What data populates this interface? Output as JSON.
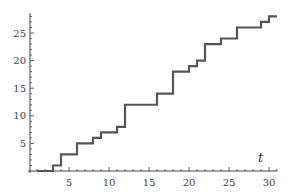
{
  "chart_data": {
    "type": "line",
    "subtype": "step",
    "title": "",
    "xlabel": "t",
    "ylabel": "",
    "xlim": [
      0,
      32
    ],
    "ylim": [
      0,
      28.5
    ],
    "xticks": [
      5,
      10,
      15,
      20,
      25,
      30
    ],
    "yticks": [
      5,
      10,
      15,
      20,
      25
    ],
    "grid": false,
    "legend": null,
    "series": [
      {
        "name": "counting process",
        "color": "#555555",
        "x": [
          1,
          3,
          4,
          6,
          8,
          9,
          11,
          12,
          16,
          18,
          20,
          21,
          22,
          24,
          26,
          29,
          30,
          31
        ],
        "values": [
          0,
          1,
          3,
          5,
          6,
          7,
          8,
          12,
          14,
          18,
          19,
          20,
          23,
          24,
          26,
          27,
          28,
          28
        ]
      }
    ]
  },
  "labels": {
    "x_axis_title": "t",
    "x_ticks": [
      "5",
      "10",
      "15",
      "20",
      "25",
      "30"
    ],
    "y_ticks": [
      "5",
      "10",
      "15",
      "20",
      "25"
    ]
  }
}
